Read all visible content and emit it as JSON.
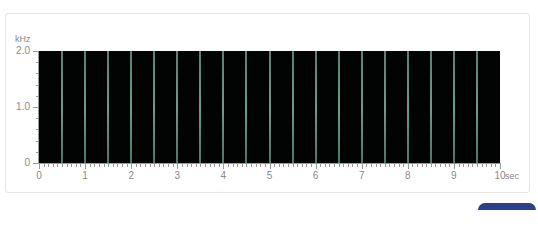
{
  "chart_data": {
    "type": "spectrogram",
    "title": "",
    "xlabel": "sec",
    "ylabel": "kHz",
    "xlim": [
      0,
      10
    ],
    "ylim": [
      0,
      2.0
    ],
    "x_ticks": [
      "0",
      "1",
      "2",
      "3",
      "4",
      "5",
      "6",
      "7",
      "8",
      "9",
      "10"
    ],
    "x_minor_tick_step": 0.1,
    "y_ticks": [
      "0",
      "1.0",
      "2.0"
    ],
    "y_minor_tick_step": 0.2,
    "background_color": "#020403",
    "line_color": "#6f9a8d",
    "events": {
      "description": "Broadband vertical pulse lines spanning 0–2.0 kHz",
      "times_sec": [
        0.5,
        1.0,
        1.5,
        2.0,
        2.5,
        3.0,
        3.5,
        4.0,
        4.5,
        5.0,
        5.5,
        6.0,
        6.5,
        7.0,
        7.5,
        8.0,
        8.5,
        9.0,
        9.5
      ],
      "freq_range_khz": [
        0,
        2.0
      ]
    },
    "grid": false,
    "legend": null
  },
  "axis": {
    "y_unit": "kHz",
    "x_unit": "sec",
    "y_labels": [
      {
        "value": 2.0,
        "text": "2.0"
      },
      {
        "value": 1.0,
        "text": "1.0"
      },
      {
        "value": 0,
        "text": "0"
      }
    ],
    "x_labels": [
      "0",
      "1",
      "2",
      "3",
      "4",
      "5",
      "6",
      "7",
      "8",
      "9",
      "10"
    ]
  },
  "badge": {
    "text": ""
  }
}
